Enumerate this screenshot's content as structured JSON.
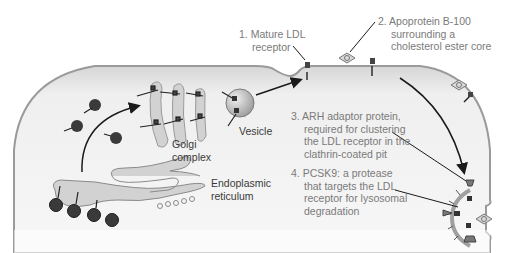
{
  "diagram": {
    "organelles": {
      "golgi": {
        "label_lines": [
          "Golgi",
          "complex"
        ]
      },
      "vesicle": {
        "label": "Vesicle"
      },
      "er": {
        "label_lines": [
          "Endoplasmic",
          "reticulum"
        ]
      }
    },
    "callouts": [
      {
        "number": "1.",
        "lines": [
          "Mature LDL",
          "receptor"
        ]
      },
      {
        "number": "2.",
        "lines": [
          "Apoprotein B-100",
          "surrounding a",
          "cholesterol ester core"
        ]
      },
      {
        "number": "3.",
        "lines": [
          "ARH adaptor protein,",
          "required for clustering",
          "the LDL receptor in the",
          "clathrin-coated pit"
        ]
      },
      {
        "number": "4.",
        "lines": [
          "PCSK9: a protease",
          "that targets the LDL",
          "receptor for lysosomal",
          "degradation"
        ]
      }
    ],
    "colors": {
      "cell_fill": "#e9e9e9",
      "membrane": "#9a9a9a",
      "organelle_fill": "#cfcfcf",
      "ribosome": "#3a3a3a",
      "callout_text": "#7a7a7a",
      "organelle_text": "#3a3a3a"
    }
  }
}
